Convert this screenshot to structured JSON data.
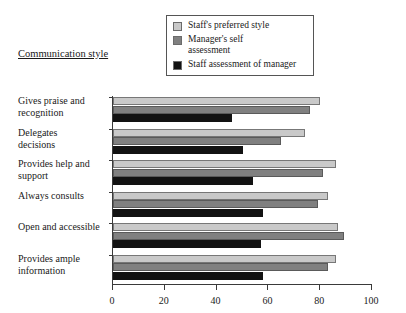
{
  "axis_title": "Communication style",
  "legend": {
    "items": [
      {
        "label": "Staff's preferred style",
        "color": "#c9c9c9",
        "swatch_name": "legend-swatch-staff-preferred"
      },
      {
        "label": "Manager's self\nassessment",
        "color": "#808080",
        "swatch_name": "legend-swatch-manager-self"
      },
      {
        "label": "Staff assessment of manager",
        "color": "#121212",
        "swatch_name": "legend-swatch-staff-of-manager"
      }
    ]
  },
  "chart_data": {
    "type": "bar",
    "orientation": "horizontal",
    "title": "Communication style",
    "xlabel": "",
    "ylabel": "Communication style",
    "xlim": [
      0,
      100
    ],
    "xticks": [
      0,
      20,
      40,
      60,
      80,
      100
    ],
    "grid": false,
    "legend_position": "top-center",
    "categories": [
      "Gives praise and\nrecognition",
      "Delegates\ndecisions",
      "Provides help and\nsupport",
      "Always consults",
      "Open and accessible",
      "Provides ample\ninformation"
    ],
    "series": [
      {
        "name": "Staff's preferred style",
        "color": "#c9c9c9",
        "values": [
          80,
          74,
          86,
          83,
          87,
          86
        ]
      },
      {
        "name": "Manager's self assessment",
        "color": "#808080",
        "values": [
          76,
          65,
          81,
          79,
          89,
          83
        ]
      },
      {
        "name": "Staff assessment of manager",
        "color": "#121212",
        "values": [
          46,
          50,
          54,
          58,
          57,
          58
        ]
      }
    ]
  }
}
